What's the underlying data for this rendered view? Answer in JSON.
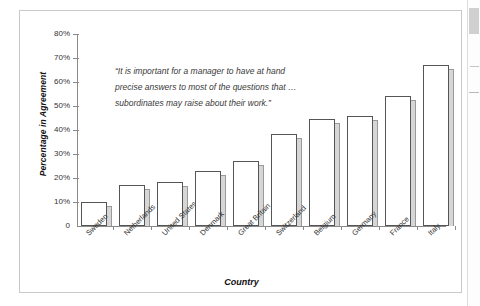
{
  "chart_data": {
    "type": "bar",
    "title": "",
    "xlabel": "Country",
    "ylabel": "Percentage in Agreement",
    "ylim": [
      0,
      80
    ],
    "ytick_labels": [
      "80%",
      "70%",
      "60%",
      "50%",
      "40%",
      "30%",
      "20%",
      "10%",
      "0"
    ],
    "ytick_values": [
      80,
      70,
      60,
      50,
      40,
      30,
      20,
      10,
      0
    ],
    "grid": false,
    "legend": null,
    "categories": [
      "Sweden",
      "Netherlands",
      "United States",
      "Denmark",
      "Great Britain",
      "Switzerland",
      "Belgium",
      "Germany",
      "France",
      "Italy"
    ],
    "values": [
      10,
      17,
      18.5,
      23,
      27,
      38.5,
      44.5,
      46,
      54,
      67
    ],
    "annotation_lines": [
      "“It is important for a manager to have at hand",
      "precise answers to most of the questions that …",
      "subordinates may raise about their work.”"
    ]
  }
}
